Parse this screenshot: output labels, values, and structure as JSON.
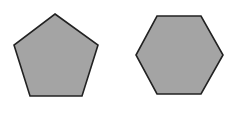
{
  "diagram": {
    "shapes": [
      {
        "name": "pentagon",
        "sides": 5,
        "points": "55,14 98,45 82,96 30,96 14,45",
        "fill": "#a4a4a4",
        "stroke": "#222222"
      },
      {
        "name": "hexagon",
        "sides": 6,
        "points": "157,16 201,16 223,55 201,94 157,94 136,55",
        "fill": "#a4a4a4",
        "stroke": "#222222"
      }
    ],
    "background": "#ffffff"
  }
}
